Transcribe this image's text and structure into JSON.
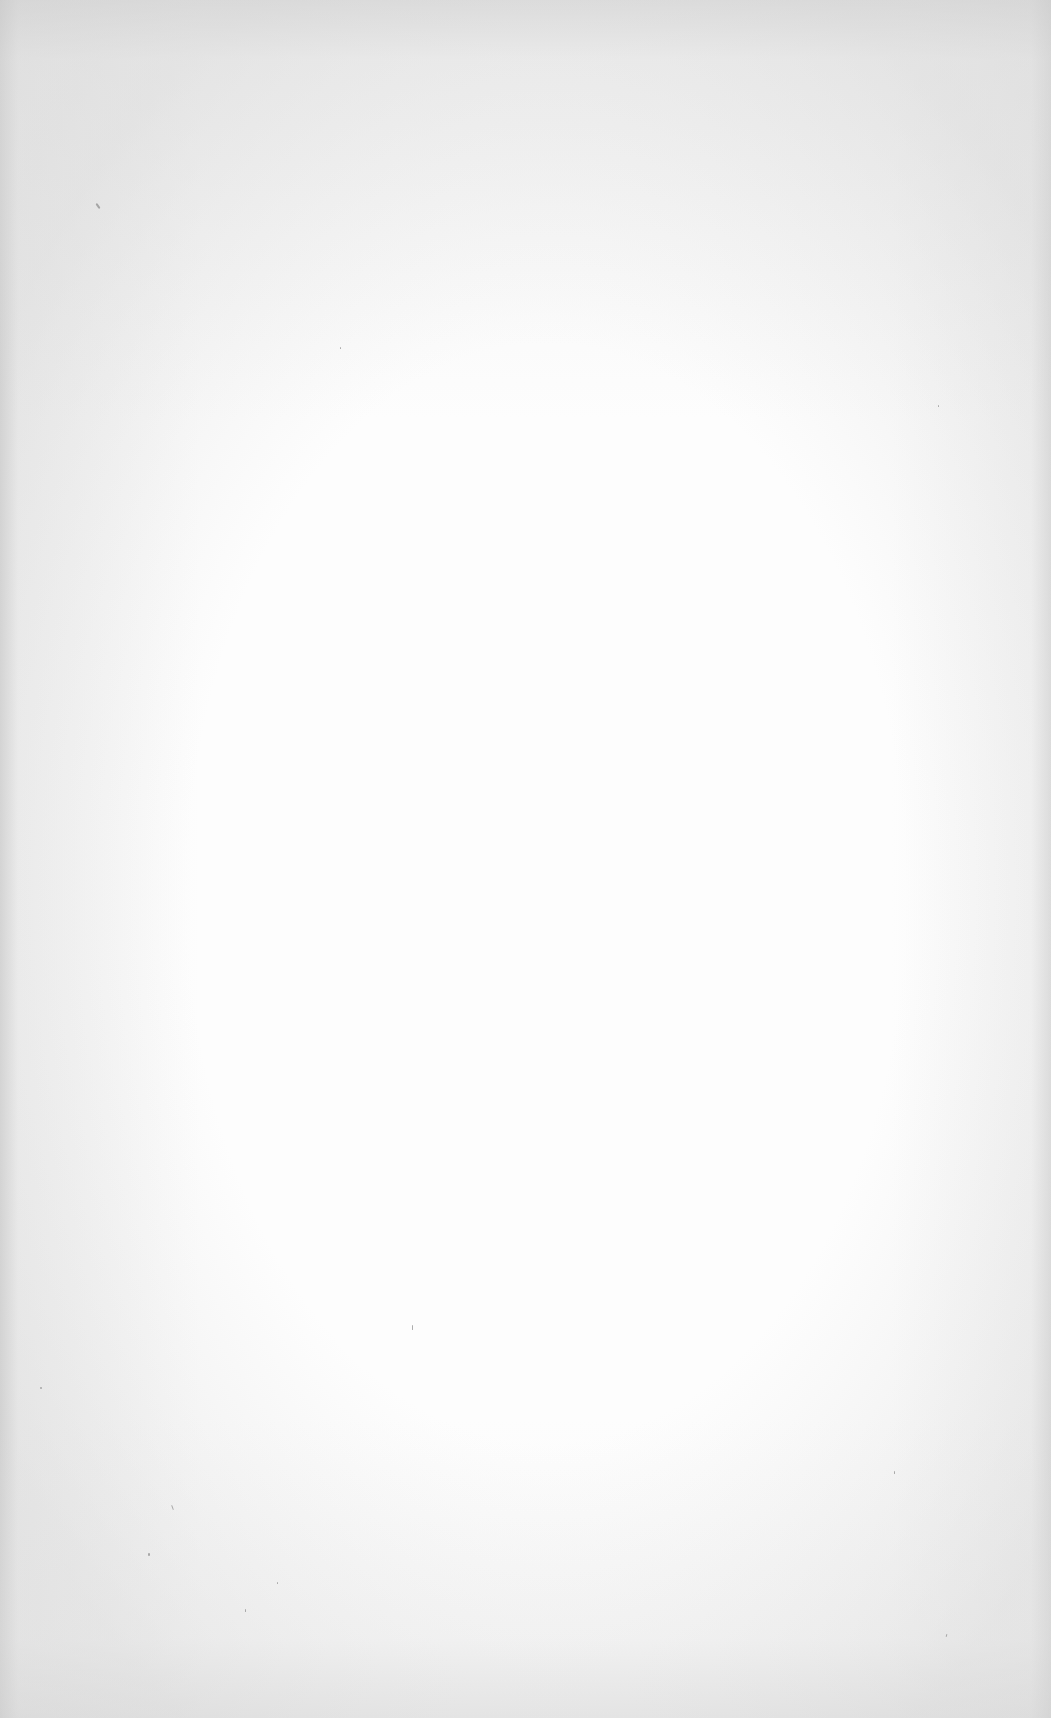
{
  "document": {
    "type": "blank-scanned-page",
    "paper_color": "#fdfdfd",
    "edge_shade_color": "#d0d0d0",
    "text_content": ""
  },
  "specks": [
    {
      "x": 97,
      "y": 203,
      "w": 2,
      "h": 6,
      "rot": -35
    },
    {
      "x": 340,
      "y": 347,
      "w": 1,
      "h": 2,
      "rot": 0
    },
    {
      "x": 938,
      "y": 405,
      "w": 1,
      "h": 2,
      "rot": 0
    },
    {
      "x": 412,
      "y": 1325,
      "w": 1,
      "h": 5,
      "rot": 0
    },
    {
      "x": 40,
      "y": 1387,
      "w": 2,
      "h": 2,
      "rot": 0
    },
    {
      "x": 172,
      "y": 1505,
      "w": 1,
      "h": 5,
      "rot": -20
    },
    {
      "x": 148,
      "y": 1553,
      "w": 2,
      "h": 3,
      "rot": 0
    },
    {
      "x": 277,
      "y": 1582,
      "w": 1,
      "h": 2,
      "rot": 0
    },
    {
      "x": 245,
      "y": 1609,
      "w": 1,
      "h": 3,
      "rot": 0
    },
    {
      "x": 894,
      "y": 1471,
      "w": 1,
      "h": 3,
      "rot": 0
    },
    {
      "x": 946,
      "y": 1634,
      "w": 1,
      "h": 3,
      "rot": 15
    }
  ]
}
